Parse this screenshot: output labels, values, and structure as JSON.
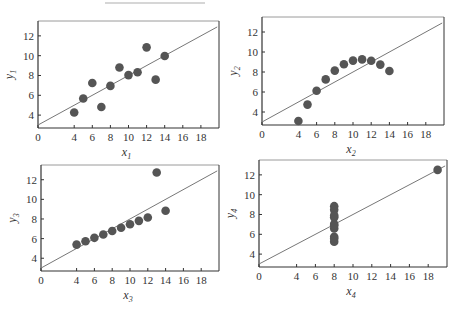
{
  "chart_data": [
    {
      "type": "scatter",
      "panel": 1,
      "title": "",
      "xlabel": "x1",
      "ylabel": "y1",
      "xlabel_base": "x",
      "xlabel_sub": "1",
      "ylabel_base": "y",
      "ylabel_sub": "1",
      "xlim": [
        0,
        20
      ],
      "ylim": [
        2.7,
        13.5
      ],
      "xticks": [
        0,
        4,
        6,
        8,
        10,
        12,
        14,
        16,
        18
      ],
      "yticks": [
        4,
        6,
        8,
        10,
        12
      ],
      "grid": false,
      "x": [
        10,
        8,
        13,
        9,
        11,
        14,
        6,
        4,
        12,
        7,
        5
      ],
      "y": [
        8.04,
        6.95,
        7.58,
        8.81,
        8.33,
        9.96,
        7.24,
        4.26,
        10.84,
        4.82,
        5.68
      ],
      "fit_line": {
        "intercept": 3.0,
        "slope": 0.5,
        "x_range": [
          0,
          20
        ]
      }
    },
    {
      "type": "scatter",
      "panel": 2,
      "title": "",
      "xlabel": "x2",
      "ylabel": "y2",
      "xlabel_base": "x",
      "xlabel_sub": "2",
      "ylabel_base": "y",
      "ylabel_sub": "2",
      "xlim": [
        0,
        20
      ],
      "ylim": [
        2.7,
        13.5
      ],
      "xticks": [
        0,
        4,
        6,
        8,
        10,
        12,
        14,
        16,
        18
      ],
      "yticks": [
        4,
        6,
        8,
        10,
        12
      ],
      "grid": false,
      "x": [
        10,
        8,
        13,
        9,
        11,
        14,
        6,
        4,
        12,
        7,
        5
      ],
      "y": [
        9.14,
        8.14,
        8.74,
        8.77,
        9.26,
        8.1,
        6.13,
        3.1,
        9.13,
        7.26,
        4.74
      ],
      "fit_line": {
        "intercept": 3.0,
        "slope": 0.5,
        "x_range": [
          0,
          20
        ]
      }
    },
    {
      "type": "scatter",
      "panel": 3,
      "title": "",
      "xlabel": "x3",
      "ylabel": "y3",
      "xlabel_base": "x",
      "xlabel_sub": "3",
      "ylabel_base": "y",
      "ylabel_sub": "3",
      "xlim": [
        0,
        20
      ],
      "ylim": [
        2.7,
        13.5
      ],
      "xticks": [
        0,
        4,
        6,
        8,
        10,
        12,
        14,
        16,
        18
      ],
      "yticks": [
        4,
        6,
        8,
        10,
        12
      ],
      "grid": false,
      "x": [
        10,
        8,
        13,
        9,
        11,
        14,
        6,
        4,
        12,
        7,
        5
      ],
      "y": [
        7.46,
        6.77,
        12.74,
        7.11,
        7.81,
        8.84,
        6.08,
        5.39,
        8.15,
        6.42,
        5.73
      ],
      "fit_line": {
        "intercept": 3.0,
        "slope": 0.5,
        "x_range": [
          0,
          20
        ]
      }
    },
    {
      "type": "scatter",
      "panel": 4,
      "title": "",
      "xlabel": "x4",
      "ylabel": "y4",
      "xlabel_base": "x",
      "xlabel_sub": "4",
      "ylabel_base": "y",
      "ylabel_sub": "4",
      "xlim": [
        0,
        20
      ],
      "ylim": [
        2.7,
        13.5
      ],
      "xticks": [
        0,
        4,
        6,
        8,
        10,
        12,
        14,
        16,
        18
      ],
      "yticks": [
        4,
        6,
        8,
        10,
        12
      ],
      "grid": false,
      "x": [
        8,
        8,
        8,
        8,
        8,
        8,
        8,
        19,
        8,
        8,
        8
      ],
      "y": [
        6.58,
        5.76,
        7.71,
        8.84,
        8.47,
        7.04,
        5.25,
        12.5,
        5.56,
        7.91,
        6.89
      ],
      "fit_line": {
        "intercept": 3.0,
        "slope": 0.5,
        "x_range": [
          0,
          20
        ]
      }
    }
  ],
  "style": {
    "marker_color": "#555555",
    "line_color": "#777777",
    "frame_color": "#333333",
    "top_frame_color": "#9a9a9a"
  },
  "layout": {
    "panels": [
      {
        "left": 38,
        "top": 21,
        "right": 219,
        "bottom": 128
      },
      {
        "left": 262,
        "top": 17,
        "right": 444,
        "bottom": 125
      },
      {
        "left": 41,
        "top": 165,
        "right": 219,
        "bottom": 271
      },
      {
        "left": 259,
        "top": 160,
        "right": 447,
        "bottom": 267
      }
    ]
  }
}
